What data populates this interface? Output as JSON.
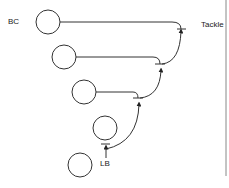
{
  "diagram": {
    "labels": {
      "bc": "BC",
      "tackle": "Tackle",
      "lb": "LB"
    },
    "colors": {
      "stroke": "#333333",
      "background": "#ffffff",
      "border": "#888888"
    },
    "nodes": [
      {
        "id": "circle-1",
        "cx": 48,
        "cy": 22,
        "r": 12
      },
      {
        "id": "circle-2",
        "cx": 64,
        "cy": 57,
        "r": 12
      },
      {
        "id": "circle-3",
        "cx": 84,
        "cy": 92,
        "r": 12
      },
      {
        "id": "circle-4",
        "cx": 105,
        "cy": 128,
        "r": 12
      },
      {
        "id": "circle-5",
        "cx": 80,
        "cy": 165,
        "r": 12
      }
    ]
  }
}
